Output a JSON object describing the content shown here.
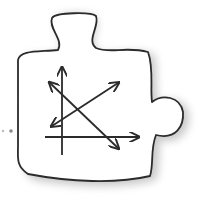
{
  "illustration": {
    "subject": "puzzle-piece-with-chart-axes",
    "colors": {
      "background": "#ffffff",
      "outline": "#2b2b2b",
      "fill": "#ffffff",
      "shadow": "#9a9a9a",
      "dots": "#8a8a8a"
    },
    "elements": [
      "puzzle-piece",
      "y-axis-arrow",
      "x-axis-arrow",
      "double-arrow-descending",
      "double-arrow-ascending",
      "connector-dots"
    ]
  }
}
